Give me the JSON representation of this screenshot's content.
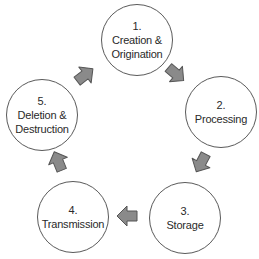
{
  "diagram": {
    "type": "cycle",
    "nodes": [
      {
        "id": "creation",
        "number": "1.",
        "label": "Creation &\nOrigination",
        "cx": 137,
        "cy": 40
      },
      {
        "id": "processing",
        "number": "2.",
        "label": "Processing",
        "cx": 221,
        "cy": 112
      },
      {
        "id": "storage",
        "number": "3.",
        "label": "Storage",
        "cx": 185,
        "cy": 218
      },
      {
        "id": "transmission",
        "number": "4.",
        "label": "Transmission",
        "cx": 73,
        "cy": 217
      },
      {
        "id": "deletion",
        "number": "5.",
        "label": "Deletion &\nDestruction",
        "cx": 42,
        "cy": 115
      }
    ],
    "edges": [
      {
        "from": "creation",
        "to": "processing",
        "cx": 176,
        "cy": 74,
        "angle": 40
      },
      {
        "from": "processing",
        "to": "storage",
        "cx": 201,
        "cy": 163,
        "angle": 110
      },
      {
        "from": "storage",
        "to": "transmission",
        "cx": 127,
        "cy": 216,
        "angle": 180
      },
      {
        "from": "transmission",
        "to": "deletion",
        "cx": 58,
        "cy": 161,
        "angle": -112
      },
      {
        "from": "deletion",
        "to": "creation",
        "cx": 85,
        "cy": 75,
        "angle": -38
      }
    ],
    "colors": {
      "circle_border": "#5a5a5a",
      "text": "#2a2a2a",
      "arrow_fill": "#8a8a8a",
      "arrow_stroke": "#555555",
      "background": "#ffffff"
    }
  }
}
